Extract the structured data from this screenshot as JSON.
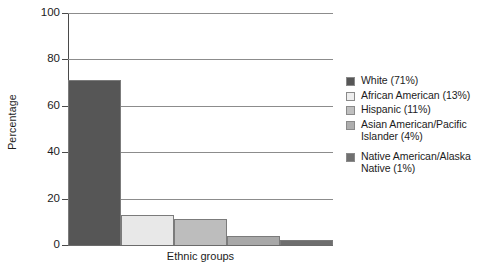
{
  "chart_data": {
    "type": "bar",
    "title": "",
    "xlabel": "Ethnic groups",
    "ylabel": "Percentage",
    "ylim": [
      0,
      100
    ],
    "yticks": [
      0,
      20,
      40,
      60,
      80,
      100
    ],
    "grid": true,
    "legend_position": "right",
    "categories": [
      "White",
      "African American",
      "Hispanic",
      "Asian American/Pacific Islander",
      "Native American/Alaska Native"
    ],
    "values": [
      71,
      13,
      11,
      4,
      2
    ],
    "legend_values": [
      71,
      13,
      11,
      4,
      1
    ],
    "colors": [
      "#565656",
      "#e8e8e8",
      "#bdbdbd",
      "#a8a8a8",
      "#6e6e6e"
    ],
    "legend_entries": [
      {
        "label": "White (71%)",
        "color": "#565656",
        "spaced": false
      },
      {
        "label": "African American (13%)",
        "color": "#eeeeee",
        "spaced": false
      },
      {
        "label": "Hispanic (11%)",
        "color": "#bfbfbf",
        "spaced": false
      },
      {
        "label": "Asian American/Pacific Islander (4%)",
        "color": "#aeaeae",
        "spaced": false
      },
      {
        "label": "Native American/Alaska Native (1%)",
        "color": "#707070",
        "spaced": true
      }
    ]
  },
  "axes": {
    "y_title": "Percentage",
    "x_title": "Ethnic groups",
    "y_tick_labels": [
      "100",
      "80",
      "60",
      "40",
      "20",
      "0"
    ]
  },
  "caption": {
    "text": ""
  }
}
